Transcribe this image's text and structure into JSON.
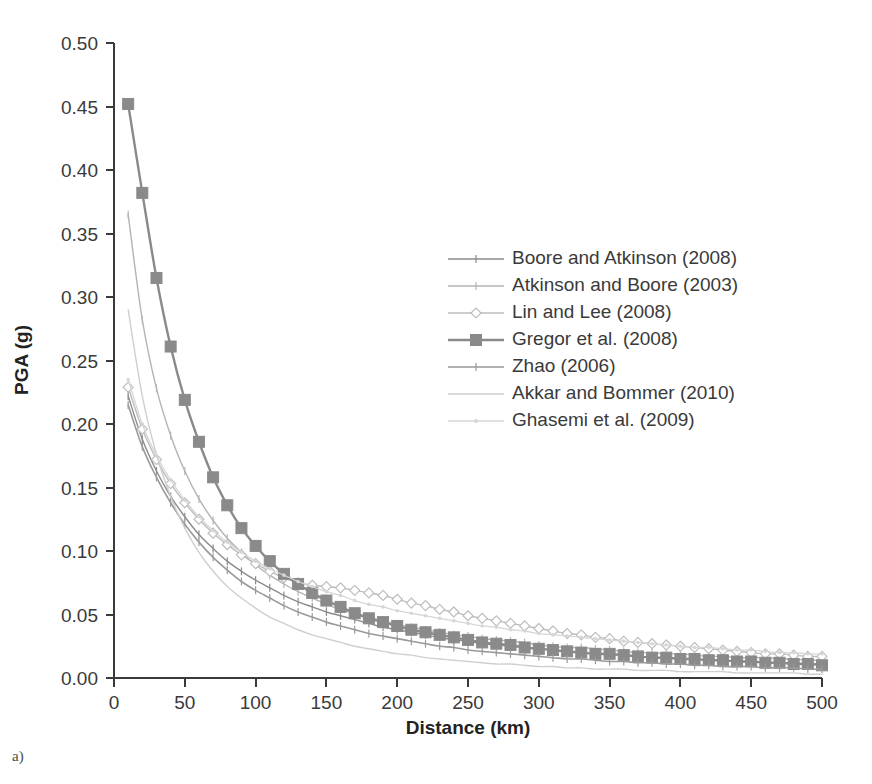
{
  "caption": "a)",
  "chart_data": {
    "type": "line",
    "title": "",
    "xlabel": "Distance (km)",
    "ylabel": "PGA (g)",
    "xlim": [
      0,
      500
    ],
    "ylim": [
      0.0,
      0.5
    ],
    "xticks": [
      0,
      50,
      100,
      150,
      200,
      250,
      300,
      350,
      400,
      450,
      500
    ],
    "xtick_labels": [
      "0",
      "50",
      "100",
      "150",
      "200",
      "250",
      "300",
      "350",
      "400",
      "450",
      "500"
    ],
    "yticks": [
      0.0,
      0.05,
      0.1,
      0.15,
      0.2,
      0.25,
      0.3,
      0.35,
      0.4,
      0.45,
      0.5
    ],
    "ytick_labels": [
      "0.00",
      "0.05",
      "0.10",
      "0.15",
      "0.20",
      "0.25",
      "0.30",
      "0.35",
      "0.40",
      "0.45",
      "0.50"
    ],
    "grid": false,
    "legend_position": "upper-center-right",
    "x": [
      10,
      20,
      30,
      40,
      50,
      60,
      70,
      80,
      90,
      100,
      110,
      120,
      130,
      140,
      150,
      160,
      170,
      180,
      190,
      200,
      210,
      220,
      230,
      240,
      250,
      260,
      270,
      280,
      290,
      300,
      310,
      320,
      330,
      340,
      350,
      360,
      370,
      380,
      390,
      400,
      410,
      420,
      430,
      440,
      450,
      460,
      470,
      480,
      490,
      500
    ],
    "series": [
      {
        "name": "Boore and Atkinson (2008)",
        "color": "#8c8c8c",
        "marker": "tick",
        "line_width": 1.4,
        "values": [
          0.222,
          0.188,
          0.163,
          0.143,
          0.127,
          0.113,
          0.102,
          0.092,
          0.084,
          0.077,
          0.071,
          0.065,
          0.06,
          0.056,
          0.052,
          0.049,
          0.046,
          0.043,
          0.04,
          0.038,
          0.036,
          0.034,
          0.032,
          0.03,
          0.029,
          0.027,
          0.026,
          0.025,
          0.024,
          0.023,
          0.022,
          0.021,
          0.02,
          0.019,
          0.018,
          0.018,
          0.017,
          0.016,
          0.016,
          0.015,
          0.015,
          0.014,
          0.014,
          0.013,
          0.013,
          0.012,
          0.012,
          0.012,
          0.011,
          0.011
        ]
      },
      {
        "name": "Atkinson and Boore (2003)",
        "color": "#b4b4b4",
        "marker": "tick",
        "line_width": 1.4,
        "values": [
          0.365,
          0.282,
          0.228,
          0.191,
          0.163,
          0.141,
          0.124,
          0.11,
          0.099,
          0.089,
          0.081,
          0.074,
          0.068,
          0.063,
          0.058,
          0.054,
          0.051,
          0.048,
          0.045,
          0.042,
          0.04,
          0.038,
          0.036,
          0.034,
          0.033,
          0.031,
          0.03,
          0.029,
          0.028,
          0.026,
          0.025,
          0.024,
          0.024,
          0.023,
          0.022,
          0.021,
          0.02,
          0.02,
          0.019,
          0.019,
          0.018,
          0.017,
          0.017,
          0.016,
          0.016,
          0.016,
          0.015,
          0.015,
          0.014,
          0.014
        ]
      },
      {
        "name": "Lin and Lee (2008)",
        "color": "#bdbdbd",
        "marker": "diamond",
        "line_width": 1.4,
        "values": [
          0.229,
          0.196,
          0.172,
          0.153,
          0.138,
          0.125,
          0.114,
          0.105,
          0.097,
          0.09,
          0.084,
          0.079,
          0.075,
          0.073,
          0.072,
          0.071,
          0.069,
          0.067,
          0.065,
          0.062,
          0.059,
          0.057,
          0.054,
          0.052,
          0.049,
          0.047,
          0.045,
          0.043,
          0.041,
          0.039,
          0.037,
          0.035,
          0.034,
          0.032,
          0.031,
          0.029,
          0.028,
          0.027,
          0.026,
          0.025,
          0.024,
          0.023,
          0.022,
          0.021,
          0.02,
          0.019,
          0.019,
          0.018,
          0.017,
          0.017
        ]
      },
      {
        "name": "Gregor et al. (2008)",
        "color": "#8a8a8a",
        "marker": "square",
        "line_width": 2.4,
        "values": [
          0.452,
          0.382,
          0.315,
          0.261,
          0.219,
          0.186,
          0.158,
          0.136,
          0.118,
          0.104,
          0.092,
          0.082,
          0.074,
          0.067,
          0.061,
          0.056,
          0.051,
          0.047,
          0.044,
          0.041,
          0.038,
          0.036,
          0.034,
          0.032,
          0.03,
          0.028,
          0.027,
          0.026,
          0.024,
          0.023,
          0.022,
          0.021,
          0.02,
          0.019,
          0.019,
          0.018,
          0.017,
          0.016,
          0.016,
          0.015,
          0.015,
          0.014,
          0.014,
          0.013,
          0.013,
          0.012,
          0.012,
          0.011,
          0.011,
          0.01
        ]
      },
      {
        "name": "Zhao (2006)",
        "color": "#9a9a9a",
        "marker": "tick",
        "line_width": 1.6,
        "values": [
          0.215,
          0.182,
          0.158,
          0.138,
          0.121,
          0.107,
          0.095,
          0.085,
          0.076,
          0.069,
          0.063,
          0.057,
          0.052,
          0.048,
          0.044,
          0.041,
          0.038,
          0.035,
          0.033,
          0.031,
          0.029,
          0.027,
          0.025,
          0.024,
          0.022,
          0.021,
          0.02,
          0.019,
          0.018,
          0.017,
          0.016,
          0.015,
          0.015,
          0.014,
          0.013,
          0.013,
          0.012,
          0.012,
          0.011,
          0.011,
          0.01,
          0.01,
          0.009,
          0.009,
          0.009,
          0.008,
          0.008,
          0.008,
          0.007,
          0.007
        ]
      },
      {
        "name": "Akkar and Bommer (2010)",
        "color": "#cfcfcf",
        "marker": "none",
        "line_width": 1.4,
        "values": [
          0.29,
          0.222,
          0.176,
          0.143,
          0.118,
          0.099,
          0.084,
          0.072,
          0.063,
          0.055,
          0.048,
          0.043,
          0.038,
          0.034,
          0.031,
          0.028,
          0.025,
          0.023,
          0.021,
          0.019,
          0.018,
          0.016,
          0.015,
          0.014,
          0.013,
          0.012,
          0.011,
          0.011,
          0.01,
          0.009,
          0.009,
          0.008,
          0.008,
          0.007,
          0.007,
          0.007,
          0.006,
          0.006,
          0.006,
          0.005,
          0.005,
          0.005,
          0.005,
          0.004,
          0.004,
          0.004,
          0.004,
          0.004,
          0.003,
          0.003
        ]
      },
      {
        "name": "Ghasemi et al. (2009)",
        "color": "#d6d6d6",
        "marker": "dot",
        "line_width": 1.3,
        "values": [
          0.235,
          0.2,
          0.175,
          0.156,
          0.14,
          0.127,
          0.116,
          0.107,
          0.099,
          0.092,
          0.086,
          0.081,
          0.076,
          0.072,
          0.068,
          0.065,
          0.061,
          0.058,
          0.056,
          0.053,
          0.051,
          0.049,
          0.047,
          0.045,
          0.043,
          0.041,
          0.04,
          0.038,
          0.037,
          0.035,
          0.034,
          0.033,
          0.032,
          0.031,
          0.03,
          0.029,
          0.028,
          0.027,
          0.026,
          0.025,
          0.024,
          0.024,
          0.023,
          0.022,
          0.022,
          0.021,
          0.02,
          0.02,
          0.019,
          0.019
        ]
      }
    ]
  }
}
